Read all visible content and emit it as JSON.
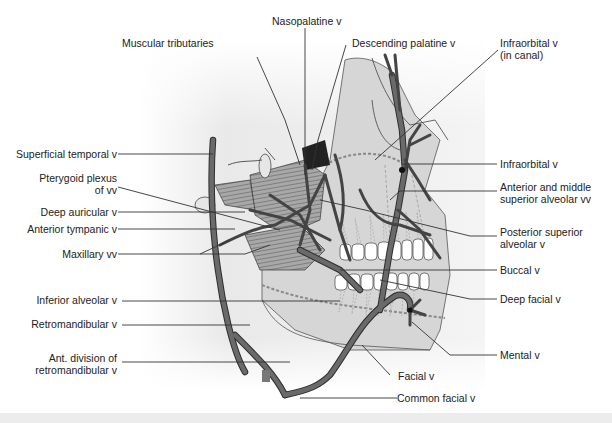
{
  "figure": {
    "colors": {
      "vein": "#5a5a5a",
      "vein_outline": "#2e2e2e",
      "skull_fill": "#dcdcdc",
      "background_shade": "#e8e8e8",
      "leader_line": "#333333",
      "muscle": "#9a9a9a",
      "teeth": "#ffffff"
    }
  },
  "labels": {
    "nasopalatine": "Nasopalatine v",
    "muscular_tributaries": "Muscular tributaries",
    "descending_palatine": "Descending palatine v",
    "infraorbital_canal": "Infraorbital v\n(in canal)",
    "superficial_temporal": "Superficial temporal v",
    "pterygoid_plexus": "Pterygoid plexus\nof vv",
    "deep_auricular": "Deep auricular v",
    "anterior_tympanic": "Anterior tympanic v",
    "maxillary": "Maxillary vv",
    "infraorbital": "Infraorbital v",
    "ant_mid_sup_alveolar": "Anterior and middle\nsuperior alveolar vv",
    "post_sup_alveolar": "Posterior superior\nalveolar v",
    "buccal": "Buccal v",
    "deep_facial": "Deep facial v",
    "inferior_alveolar": "Inferior alveolar v",
    "retromandibular": "Retromandibular v",
    "ant_division_retromandibular": "Ant. division of\nretromandibular v",
    "mental": "Mental v",
    "facial": "Facial v",
    "common_facial": "Common facial v"
  }
}
